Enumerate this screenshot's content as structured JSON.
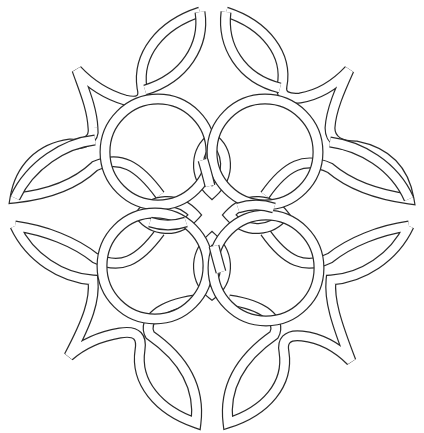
{
  "image": {
    "title": "Celtic knot line drawing",
    "description": "Black-and-white outline of an interlaced Celtic knot: four interlocking rings surrounded by eight pointed vesica lobes and four concave-corner star points, with four inner petals at the center.",
    "colors": {
      "background": "#ffffff",
      "line": "#2a2a2a",
      "band_fill": "#ffffff"
    },
    "elements": {
      "rings": 4,
      "outer_lobes": 8,
      "inner_petals": 4,
      "corner_points": 4
    }
  }
}
